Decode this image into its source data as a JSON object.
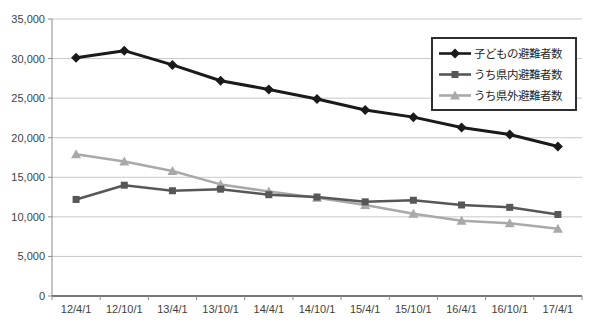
{
  "chart_data": {
    "type": "line",
    "title": "",
    "xlabel": "",
    "ylabel": "",
    "categories": [
      "12/4/1",
      "12/10/1",
      "13/4/1",
      "13/10/1",
      "14/4/1",
      "14/10/1",
      "15/4/1",
      "15/10/1",
      "16/4/1",
      "16/10/1",
      "17/4/1"
    ],
    "series": [
      {
        "name": "子どもの避難者数",
        "marker": "diamond",
        "color": "#1a1a1a",
        "line_width": 3,
        "values": [
          30100,
          31000,
          29200,
          27200,
          26100,
          24900,
          23500,
          22600,
          21300,
          20400,
          18900
        ]
      },
      {
        "name": "うち県内避難者数",
        "marker": "square",
        "color": "#575757",
        "line_width": 2.5,
        "values": [
          12200,
          14000,
          13300,
          13500,
          12800,
          12500,
          11900,
          12100,
          11500,
          11200,
          10300
        ]
      },
      {
        "name": "うち県外避難者数",
        "marker": "triangle",
        "color": "#a9a9a9",
        "line_width": 2.5,
        "values": [
          17900,
          17000,
          15800,
          14100,
          13200,
          12400,
          11500,
          10400,
          9500,
          9200,
          8500
        ]
      }
    ],
    "ylim": [
      0,
      35000
    ],
    "y_tick_step": 5000,
    "y_tick_labels": [
      "0",
      "5,000",
      "10,000",
      "15,000",
      "20,000",
      "25,000",
      "30,000",
      "35,000"
    ],
    "grid": true,
    "legend_position": "top-right",
    "colors": {
      "grid": "#c8c8c8",
      "axis": "#8c8c8c",
      "axis_line": "#4a4a4a",
      "text": "#3f3f3f",
      "background": "#ffffff",
      "legend_border": "#2e2e2e"
    }
  }
}
